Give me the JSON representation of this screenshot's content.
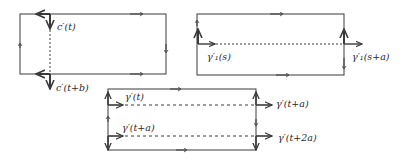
{
  "diagrams": [
    {
      "id": "left-top",
      "labels": {
        "top": "c′(t)",
        "bottom": "c′(t+b)"
      }
    },
    {
      "id": "right-top",
      "labels": {
        "left": "γ′₁(s)",
        "right": "γ′₁(s+a)"
      }
    },
    {
      "id": "bottom",
      "labels": {
        "top_left": "γ′(t)",
        "top_right": "γ′(t+a)",
        "bottom_left": "γ′(t+a)",
        "bottom_right": "γ′(t+2a)"
      }
    }
  ],
  "colors": {
    "stroke": "#3a3a3a",
    "background": "#ffffff"
  }
}
